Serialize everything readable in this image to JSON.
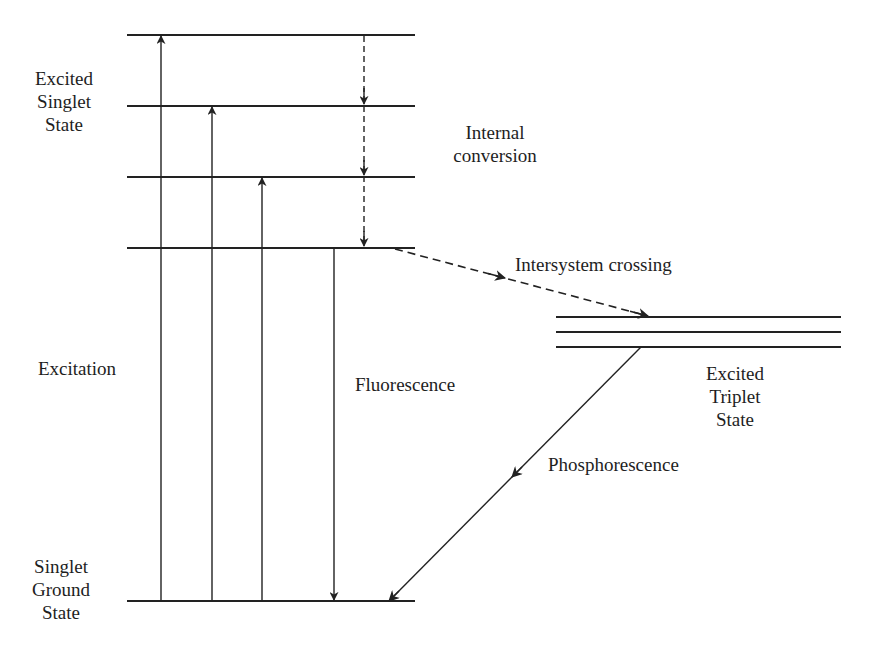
{
  "diagram": {
    "type": "Jablonski energy-level diagram",
    "labels": {
      "excited_singlet": [
        "Excited",
        "Singlet",
        "State"
      ],
      "internal_conversion": [
        "Internal",
        "conversion"
      ],
      "intersystem_crossing": "Intersystem crossing",
      "excitation": "Excitation",
      "fluorescence": "Fluorescence",
      "excited_triplet": [
        "Excited",
        "Triplet",
        "State"
      ],
      "phosphorescence": "Phosphorescence",
      "singlet_ground": [
        "Singlet",
        "Ground",
        "State"
      ]
    },
    "levels": {
      "singlet_excited_y": [
        35,
        106,
        177,
        248
      ],
      "singlet_x": [
        127,
        415
      ],
      "ground_y": 601,
      "triplet_y": [
        317,
        332,
        347
      ],
      "triplet_x": [
        556,
        841
      ]
    },
    "transitions": [
      {
        "name": "excitation-1",
        "from": "ground",
        "to": "S1-v3",
        "style": "solid",
        "direction": "up"
      },
      {
        "name": "excitation-2",
        "from": "ground",
        "to": "S1-v2",
        "style": "solid",
        "direction": "up"
      },
      {
        "name": "excitation-3",
        "from": "ground",
        "to": "S1-v1",
        "style": "solid",
        "direction": "up"
      },
      {
        "name": "fluorescence",
        "from": "S1-v0",
        "to": "ground",
        "style": "solid",
        "direction": "down"
      },
      {
        "name": "internal-conversion",
        "from": "S1-v3",
        "to": "S1-v0",
        "style": "dashed",
        "direction": "down"
      },
      {
        "name": "intersystem-crossing",
        "from": "S1-v0",
        "to": "T1",
        "style": "dashed",
        "direction": "diagonal"
      },
      {
        "name": "phosphorescence",
        "from": "T1",
        "to": "ground",
        "style": "solid",
        "direction": "diagonal"
      }
    ],
    "line_color": "#222222"
  }
}
